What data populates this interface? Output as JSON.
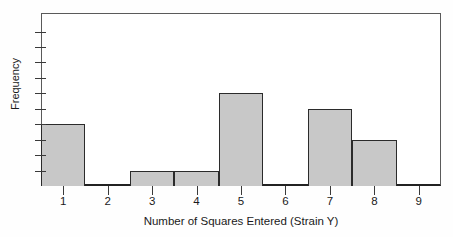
{
  "chart_data": {
    "type": "bar",
    "title": "",
    "xlabel": "Number of Squares Entered (Strain Y)",
    "ylabel": "Frequency",
    "categories": [
      "1",
      "2",
      "3",
      "4",
      "5",
      "6",
      "7",
      "8",
      "9"
    ],
    "values": [
      4,
      0,
      1,
      1,
      6,
      0,
      5,
      3,
      0
    ],
    "xtick_labels": [
      "1",
      "2",
      "3",
      "4",
      "5",
      "6",
      "7",
      "8",
      "9"
    ],
    "ytick_labels": [
      "1",
      "2",
      "3",
      "4",
      "5",
      "6",
      "7",
      "8",
      "9",
      "10"
    ],
    "xlim": [
      0.5,
      9.5
    ],
    "ylim": [
      0,
      11
    ],
    "grid": false,
    "legend": false,
    "bin_width": 1,
    "bar_fill_color": "#c8c8c8",
    "bar_edge_color": "#2b2b2b",
    "axis_color": "#3a3a3a",
    "background_color": "#ffffff"
  }
}
